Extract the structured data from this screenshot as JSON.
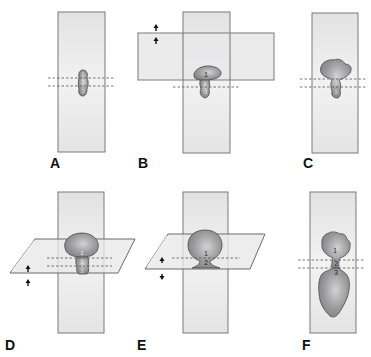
{
  "figure": {
    "panels": [
      {
        "id": "A",
        "label": "A",
        "regions": [
          "1",
          "2",
          "3"
        ]
      },
      {
        "id": "B",
        "label": "B",
        "regions": [
          "1",
          "2",
          "3"
        ]
      },
      {
        "id": "C",
        "label": "C",
        "regions": [
          "1",
          "2",
          "3"
        ]
      },
      {
        "id": "D",
        "label": "D",
        "regions": [
          "1",
          "2",
          "3"
        ]
      },
      {
        "id": "E",
        "label": "E",
        "regions": [
          "1",
          "2"
        ]
      },
      {
        "id": "F",
        "label": "F",
        "regions": [
          "1",
          "2",
          "3"
        ]
      }
    ],
    "colors": {
      "plane_fill": "#e9e9ea",
      "plane_stroke": "#7a7a7a",
      "shape_fill": "#8c8c8e",
      "shape_highlight": "#c9c9cb",
      "shape_stroke": "#4a4a4a",
      "dash": "#555555",
      "arrow": "#111111"
    },
    "icons": {
      "arrow_pair": "up-arrows",
      "arrow_pair_split": "up-down-arrows"
    }
  }
}
